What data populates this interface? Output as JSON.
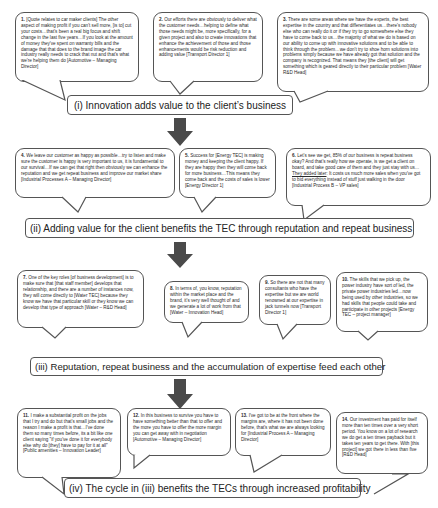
{
  "stages": [
    {
      "label": "(i) Innovation adds value to the client’s business"
    },
    {
      "label": "(ii) Adding value for the client benefits the TEC through reputation and repeat business"
    },
    {
      "label": "(iii) Reputation, repeat business and the accumulation of expertise feed each other"
    },
    {
      "label": "(iv) The cycle in (iii) benefits the TECs through increased profitability"
    }
  ],
  "quotes": [
    {
      "num": "1.",
      "text": "[Quote relates to car maker clients] The other aspect of making profit if you can't sell more, [is to] cut your costs…that's been a real big focus and shift change in the last five years…If you look at the amount of money they've spent on warranty bills and the damage that that does to the brand image the car industry really needs to crack that nut and that's what we're helping them do [Automotive – Managing Director]"
    },
    {
      "num": "2.",
      "text": "Our efforts there are obviously to deliver what the customer needs…helping to define what those needs might be, more specifically, for a given project and also to create innovations that enhance the achievement of those and those enhancements would be risk reduction and adding value [Transport Director 1]"
    },
    {
      "num": "3.",
      "text": "There are some areas where we have the experts, the best expertise in the country and that differentiates us…there's nobody else who can really do it or if they try to go somewhere else they have to come back to us…the majority of what we do is based on our ability to come up with innovative solutions and to be able to think through the problem…we don't try to shoe horn solutions into problems simply because we have already got that solution and the company is recognized. That means they [the client] will get something which is geared directly to their particular problem [Water R&D Head]"
    },
    {
      "num": "4.",
      "text": "We leave our customer as happy as possible…try to listen and make sure the customer is happy is very important to us, it is fundamental to our survival…If we can get that right then obviously we can enhance the reputation and we get repeat business and improve our market share [Industrial Processes A – Managing Director]"
    },
    {
      "num": "5.",
      "text": "Success for [Energy TEC] is making money and keeping the client happy. If they are happy then they will come back for more business…This means they come back and the costs of sales is lower [Energy Director 1]"
    },
    {
      "num": "6.",
      "text_before": "Let's see we get, 85% of our business is repeat business okay? And that's really how we operate, is we get a client on board, and take good care of them and they just stay with us…",
      "text_underlined": "They added later",
      "text_after": ": It costs us much more sales when you've got to bid everything instead of stuff just walking in the door [Industrial Process B – VP sales]"
    },
    {
      "num": "7.",
      "text": "One of the key roles [of business development] is to make sure that [that staff member] develops that relationship, and there are a number of instances now, they will come directly to [Water TEC] because they know we have that particular skill or they know we can develop that type of approach [Water – R&D Head]"
    },
    {
      "num": "8.",
      "text": "In terms of, you know, reputation within the market place and the brand, it's very well thought of and we generate a lot of work from that [Water – Innovation Head]"
    },
    {
      "num": "9.",
      "text": "So there are not that many consultants who have the expertise but we are world renowned at our expertise in jack tunnels now [Transport Director 1]"
    },
    {
      "num": "10.",
      "text": "The skills that we pick up, the power industry have sort of led, the private power industries led…now being used by other industries, so we had skills that people could take and participate in other projects [Energy TEC – project manager]"
    },
    {
      "num": "11.",
      "text": "I make a substantial profit on the jobs that I try and do but that's small jobs and the reason I make a profit is that…I've done them so many times before, its a bit like one client saying \"if you've done it for everybody else why do [they] have to pay for it at all\" [Public amenities – Innovation Leader]"
    },
    {
      "num": "12.",
      "text": "In this business to survive you have to have something better than that to offer and the more you have to offer the more margin you can get away with in negotiation [Automotive – Managing Director]"
    },
    {
      "num": "13.",
      "text": "I've got to be at the front where the margins are, where it has not been done before, that's what we are always looking for [Industrial Process A – Managing Director]"
    },
    {
      "num": "14.",
      "text": "Our investment has paid for itself more than ten times over a very short period. You know on a lot of research we do get a ten times payback but it takes ten years to get there. With [this project] we got there in less than five [R&D Head]"
    }
  ],
  "colors": {
    "arrow": "#4a4a4a",
    "border": "#555555",
    "text": "#2a2a2a"
  }
}
